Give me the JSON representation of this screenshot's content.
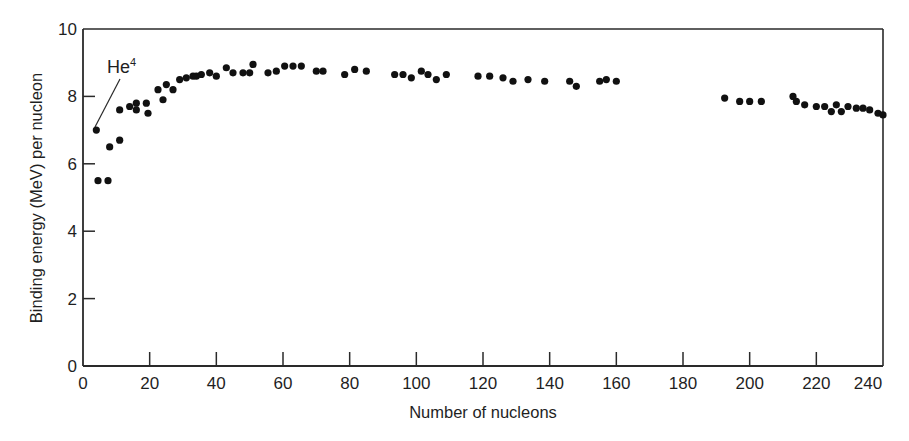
{
  "chart_data": {
    "type": "scatter",
    "title": "",
    "xlabel": "Number of nucleons",
    "ylabel": "Binding energy (MeV) per nucleon",
    "xlim": [
      0,
      240
    ],
    "ylim": [
      0,
      10
    ],
    "x_ticks": [
      0,
      20,
      40,
      60,
      80,
      100,
      120,
      140,
      160,
      180,
      200,
      220,
      240
    ],
    "y_ticks": [
      0,
      2,
      4,
      6,
      8,
      10
    ],
    "grid": false,
    "legend": null,
    "marker_color": "#111111",
    "annotations": [
      {
        "text": "He",
        "superscript": "4",
        "points_to": {
          "x": 4,
          "y": 7.0
        }
      }
    ],
    "series": [
      {
        "name": "Binding energy per nucleon",
        "points": [
          {
            "x": 4,
            "y": 7.0
          },
          {
            "x": 4.5,
            "y": 5.5
          },
          {
            "x": 7.5,
            "y": 5.5
          },
          {
            "x": 8,
            "y": 6.5
          },
          {
            "x": 11,
            "y": 6.7
          },
          {
            "x": 11,
            "y": 7.6
          },
          {
            "x": 14,
            "y": 7.7
          },
          {
            "x": 16,
            "y": 7.8
          },
          {
            "x": 16,
            "y": 7.6
          },
          {
            "x": 19,
            "y": 7.8
          },
          {
            "x": 19.5,
            "y": 7.5
          },
          {
            "x": 22.5,
            "y": 8.2
          },
          {
            "x": 24,
            "y": 7.9
          },
          {
            "x": 25,
            "y": 8.35
          },
          {
            "x": 27,
            "y": 8.2
          },
          {
            "x": 29,
            "y": 8.5
          },
          {
            "x": 31,
            "y": 8.55
          },
          {
            "x": 33,
            "y": 8.6
          },
          {
            "x": 34,
            "y": 8.6
          },
          {
            "x": 35.5,
            "y": 8.65
          },
          {
            "x": 38,
            "y": 8.7
          },
          {
            "x": 40,
            "y": 8.6
          },
          {
            "x": 43,
            "y": 8.85
          },
          {
            "x": 45,
            "y": 8.7
          },
          {
            "x": 48,
            "y": 8.7
          },
          {
            "x": 50,
            "y": 8.7
          },
          {
            "x": 51,
            "y": 8.95
          },
          {
            "x": 55.5,
            "y": 8.7
          },
          {
            "x": 58,
            "y": 8.75
          },
          {
            "x": 60.5,
            "y": 8.9
          },
          {
            "x": 63,
            "y": 8.9
          },
          {
            "x": 65.5,
            "y": 8.9
          },
          {
            "x": 70,
            "y": 8.75
          },
          {
            "x": 72,
            "y": 8.75
          },
          {
            "x": 78.5,
            "y": 8.65
          },
          {
            "x": 81.5,
            "y": 8.8
          },
          {
            "x": 85,
            "y": 8.75
          },
          {
            "x": 93.5,
            "y": 8.65
          },
          {
            "x": 96,
            "y": 8.65
          },
          {
            "x": 98.5,
            "y": 8.55
          },
          {
            "x": 101.5,
            "y": 8.75
          },
          {
            "x": 103.5,
            "y": 8.65
          },
          {
            "x": 106,
            "y": 8.5
          },
          {
            "x": 109,
            "y": 8.65
          },
          {
            "x": 118.5,
            "y": 8.6
          },
          {
            "x": 122,
            "y": 8.6
          },
          {
            "x": 126,
            "y": 8.55
          },
          {
            "x": 129,
            "y": 8.45
          },
          {
            "x": 133.5,
            "y": 8.5
          },
          {
            "x": 138.5,
            "y": 8.45
          },
          {
            "x": 146,
            "y": 8.45
          },
          {
            "x": 148,
            "y": 8.3
          },
          {
            "x": 155,
            "y": 8.45
          },
          {
            "x": 157,
            "y": 8.5
          },
          {
            "x": 160,
            "y": 8.45
          },
          {
            "x": 192.5,
            "y": 7.95
          },
          {
            "x": 197,
            "y": 7.85
          },
          {
            "x": 200,
            "y": 7.85
          },
          {
            "x": 203.5,
            "y": 7.85
          },
          {
            "x": 213,
            "y": 8.0
          },
          {
            "x": 214,
            "y": 7.85
          },
          {
            "x": 216.5,
            "y": 7.75
          },
          {
            "x": 220,
            "y": 7.7
          },
          {
            "x": 222.5,
            "y": 7.7
          },
          {
            "x": 224.5,
            "y": 7.55
          },
          {
            "x": 226,
            "y": 7.75
          },
          {
            "x": 227.5,
            "y": 7.55
          },
          {
            "x": 229.5,
            "y": 7.7
          },
          {
            "x": 232,
            "y": 7.65
          },
          {
            "x": 234,
            "y": 7.65
          },
          {
            "x": 236,
            "y": 7.6
          },
          {
            "x": 238.5,
            "y": 7.5
          },
          {
            "x": 240,
            "y": 7.45
          }
        ]
      }
    ]
  }
}
